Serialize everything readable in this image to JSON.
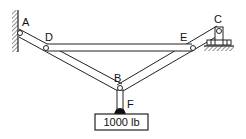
{
  "diagram": {
    "type": "truss-structure",
    "labels": {
      "A": "A",
      "B": "B",
      "C": "C",
      "D": "D",
      "E": "E",
      "F": "F"
    },
    "load": {
      "text": "1000 lb"
    },
    "members": [
      "AB",
      "BC",
      "DE",
      "BF"
    ],
    "supports": {
      "A": "wall-pin",
      "C": "roller-pin"
    }
  }
}
